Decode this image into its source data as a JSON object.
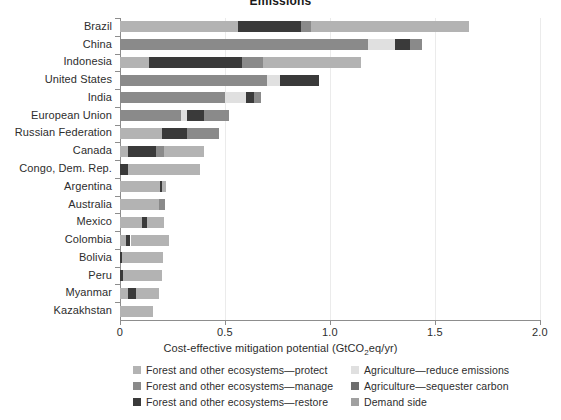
{
  "title": "Emissions",
  "axis": {
    "x_label": "Cost-effective mitigation potential (GtCO2eq/yr)",
    "x_label_pre": "Cost-effective mitigation potential (GtCO",
    "x_label_sub": "2",
    "x_label_post": "eq/yr)",
    "x_ticks": [
      "0",
      "0.5",
      "1.0",
      "1.5",
      "2.0"
    ],
    "x_tick_values": [
      0,
      0.5,
      1.0,
      1.5,
      2.0
    ],
    "xlim": [
      0,
      2.0
    ]
  },
  "colors": {
    "protect": "#b3b3b3",
    "manage": "#8a8a8a",
    "restore": "#3a3a3a",
    "agri_reduce": "#e0e0e0",
    "agri_sequester": "#6e6e6e",
    "demand_side": "#a0a0a0",
    "axis": "#8d8d8d",
    "grid": "#ebebeb",
    "text": "#2d2d2d"
  },
  "legend": {
    "position": "bottom",
    "items": [
      {
        "label": "Forest and other ecosystems—protect",
        "color_key": "protect",
        "col": 0,
        "row": 0
      },
      {
        "label": "Forest and other ecosystems—manage",
        "color_key": "manage",
        "col": 0,
        "row": 1
      },
      {
        "label": "Forest and other ecosystems—restore",
        "color_key": "restore",
        "col": 0,
        "row": 2
      },
      {
        "label": "Agriculture—reduce emissions",
        "color_key": "agri_reduce",
        "col": 1,
        "row": 0
      },
      {
        "label": "Agriculture—sequester carbon",
        "color_key": "agri_sequester",
        "col": 1,
        "row": 1
      },
      {
        "label": "Demand side",
        "color_key": "demand_side",
        "col": 1,
        "row": 2
      }
    ]
  },
  "chart_data": {
    "type": "bar",
    "orientation": "horizontal",
    "stacked": true,
    "title": "Emissions",
    "xlabel": "Cost-effective mitigation potential (GtCO2eq/yr)",
    "ylabel": "",
    "xlim": [
      0,
      2.0
    ],
    "grid": true,
    "series": [
      {
        "name": "Forest and other ecosystems—protect",
        "key": "protect"
      },
      {
        "name": "Forest and other ecosystems—manage",
        "key": "manage"
      },
      {
        "name": "Forest and other ecosystems—restore",
        "key": "restore"
      },
      {
        "name": "Agriculture—reduce emissions",
        "key": "agri_reduce"
      },
      {
        "name": "Agriculture—sequester carbon",
        "key": "agri_sequester"
      },
      {
        "name": "Demand side",
        "key": "demand_side"
      }
    ],
    "categories": [
      "Brazil",
      "China",
      "Indonesia",
      "United States",
      "India",
      "European Union",
      "Russian Federation",
      "Canada",
      "Congo, Dem. Rep.",
      "Argentina",
      "Australia",
      "Mexico",
      "Colombia",
      "Bolivia",
      "Peru",
      "Myanmar",
      "Kazakhstan"
    ],
    "rows": [
      {
        "category": "Brazil",
        "total": 1.66,
        "segments": [
          {
            "key": "protect",
            "value": 0.56
          },
          {
            "key": "restore",
            "value": 0.3
          },
          {
            "key": "manage",
            "value": 0.05
          },
          {
            "key": "protect",
            "value": 0.75
          }
        ]
      },
      {
        "category": "China",
        "total": 1.44,
        "segments": [
          {
            "key": "manage",
            "value": 1.18
          },
          {
            "key": "agri_reduce",
            "value": 0.13
          },
          {
            "key": "restore",
            "value": 0.07
          },
          {
            "key": "manage",
            "value": 0.06
          }
        ]
      },
      {
        "category": "Indonesia",
        "total": 1.15,
        "segments": [
          {
            "key": "protect",
            "value": 0.14
          },
          {
            "key": "restore",
            "value": 0.44
          },
          {
            "key": "manage",
            "value": 0.1
          },
          {
            "key": "protect",
            "value": 0.47
          }
        ]
      },
      {
        "category": "United States",
        "total": 0.95,
        "segments": [
          {
            "key": "manage",
            "value": 0.7
          },
          {
            "key": "agri_reduce",
            "value": 0.06
          },
          {
            "key": "restore",
            "value": 0.19
          }
        ]
      },
      {
        "category": "India",
        "total": 0.67,
        "segments": [
          {
            "key": "manage",
            "value": 0.5
          },
          {
            "key": "agri_reduce",
            "value": 0.1
          },
          {
            "key": "restore",
            "value": 0.04
          },
          {
            "key": "manage",
            "value": 0.03
          }
        ]
      },
      {
        "category": "European Union",
        "total": 0.52,
        "segments": [
          {
            "key": "manage",
            "value": 0.29
          },
          {
            "key": "agri_reduce",
            "value": 0.03
          },
          {
            "key": "restore",
            "value": 0.08
          },
          {
            "key": "manage",
            "value": 0.12
          }
        ]
      },
      {
        "category": "Russian Federation",
        "total": 0.47,
        "segments": [
          {
            "key": "protect",
            "value": 0.2
          },
          {
            "key": "restore",
            "value": 0.12
          },
          {
            "key": "manage",
            "value": 0.15
          }
        ]
      },
      {
        "category": "Canada",
        "total": 0.4,
        "segments": [
          {
            "key": "protect",
            "value": 0.04
          },
          {
            "key": "restore",
            "value": 0.13
          },
          {
            "key": "manage",
            "value": 0.04
          },
          {
            "key": "protect",
            "value": 0.19
          }
        ]
      },
      {
        "category": "Congo, Dem. Rep.",
        "total": 0.38,
        "segments": [
          {
            "key": "restore",
            "value": 0.04
          },
          {
            "key": "protect",
            "value": 0.34
          }
        ]
      },
      {
        "category": "Argentina",
        "total": 0.22,
        "segments": [
          {
            "key": "protect",
            "value": 0.19
          },
          {
            "key": "restore",
            "value": 0.01
          },
          {
            "key": "protect",
            "value": 0.02
          }
        ]
      },
      {
        "category": "Australia",
        "total": 0.215,
        "segments": [
          {
            "key": "protect",
            "value": 0.185
          },
          {
            "key": "manage",
            "value": 0.03
          }
        ]
      },
      {
        "category": "Mexico",
        "total": 0.21,
        "segments": [
          {
            "key": "protect",
            "value": 0.105
          },
          {
            "key": "restore",
            "value": 0.025
          },
          {
            "key": "protect",
            "value": 0.08
          }
        ]
      },
      {
        "category": "Colombia",
        "total": 0.235,
        "segments": [
          {
            "key": "protect",
            "value": 0.03
          },
          {
            "key": "restore",
            "value": 0.02
          },
          {
            "key": "protect",
            "value": 0.185
          }
        ]
      },
      {
        "category": "Bolivia",
        "total": 0.205,
        "segments": [
          {
            "key": "restore",
            "value": 0.01
          },
          {
            "key": "protect",
            "value": 0.195
          }
        ]
      },
      {
        "category": "Peru",
        "total": 0.2,
        "segments": [
          {
            "key": "restore",
            "value": 0.012
          },
          {
            "key": "protect",
            "value": 0.188
          }
        ]
      },
      {
        "category": "Myanmar",
        "total": 0.185,
        "segments": [
          {
            "key": "protect",
            "value": 0.04
          },
          {
            "key": "restore",
            "value": 0.035
          },
          {
            "key": "protect",
            "value": 0.11
          }
        ]
      },
      {
        "category": "Kazakhstan",
        "total": 0.155,
        "segments": [
          {
            "key": "protect",
            "value": 0.155
          }
        ]
      }
    ]
  }
}
